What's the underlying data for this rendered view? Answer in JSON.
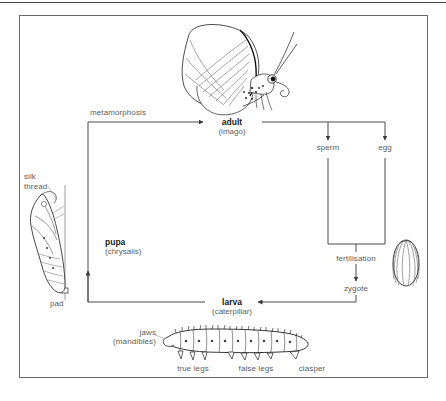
{
  "figure": {
    "type": "cycle-diagram",
    "background": "#ffffff",
    "frame_color": "#6b6b6b",
    "text_color": "#5c5c5c",
    "bold_text_color": "#1a1a1a"
  },
  "stages": {
    "adult": {
      "name": "adult",
      "sub": "(imago)"
    },
    "pupa": {
      "name": "pupa",
      "sub": "(chrysalis)"
    },
    "larva": {
      "name": "larva",
      "sub": "(caterpillar)"
    }
  },
  "nodes": {
    "metamorphosis": "metamorphosis",
    "sperm": "sperm",
    "egg": "egg",
    "fertilisation": "fertilisation",
    "zygote": "zygote"
  },
  "annotations": {
    "silk_thread_line1": "silk",
    "silk_thread_line2": "thread",
    "pad": "pad",
    "jaws": "jaws",
    "mandibles": "(mandibles)",
    "true_legs": "true legs",
    "false_legs": "false legs",
    "clasper": "clasper"
  },
  "illustrations": {
    "butterfly": "butterfly-side-view-illustration",
    "chrysalis": "chrysalis-illustration",
    "caterpillar": "caterpillar-illustration",
    "egg": "egg-illustration"
  }
}
